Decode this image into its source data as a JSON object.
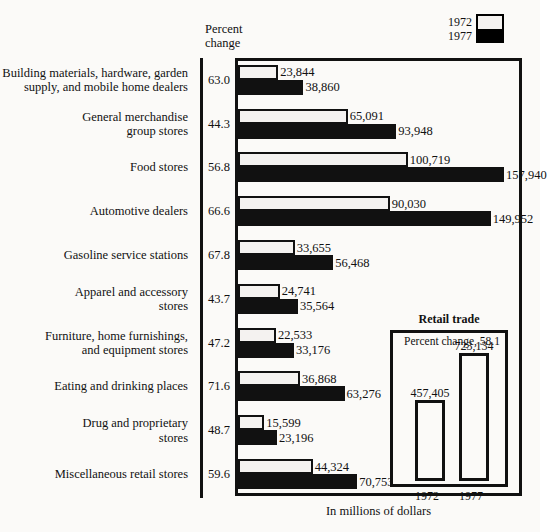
{
  "legend": {
    "entries": [
      {
        "label": "1972",
        "swatch": "white-swatch"
      },
      {
        "label": "1977",
        "swatch": "black-swatch"
      }
    ]
  },
  "axis": {
    "pct_header_line1": "Percent",
    "pct_header_line2": "change",
    "caption": "In millions of dollars"
  },
  "inset": {
    "title": "Retail trade",
    "subtitle": "Percent change, 58.1",
    "bars": [
      {
        "year": "1972",
        "value": "457,405",
        "number": 457405
      },
      {
        "year": "1977",
        "value": "723,134",
        "number": 723134
      }
    ]
  },
  "chart_data": {
    "type": "bar",
    "orientation": "horizontal",
    "title": "",
    "xlabel": "In millions of dollars",
    "ylabel": "",
    "grid": false,
    "legend_position": "top-right",
    "xlim": [
      0,
      165000
    ],
    "categories": [
      "Building materials, hardware, garden\nsupply, and mobile home dealers",
      "General merchandise\ngroup stores",
      "Food stores",
      "Automotive dealers",
      "Gasoline service stations",
      "Apparel and accessory\nstores",
      "Furniture, home furnishings,\nand equipment stores",
      "Eating and drinking places",
      "Drug and proprietary\nstores",
      "Miscellaneous retail stores"
    ],
    "percent_change": [
      "63.0",
      "44.3",
      "56.8",
      "66.6",
      "67.8",
      "43.7",
      "47.2",
      "71.6",
      "48.7",
      "59.6"
    ],
    "series": [
      {
        "name": "1972",
        "values": [
          23844,
          65091,
          100719,
          90030,
          33655,
          24741,
          22533,
          36868,
          15599,
          44324
        ],
        "labels": [
          "23,844",
          "65,091",
          "100,719",
          "90,030",
          "33,655",
          "24,741",
          "22,533",
          "36,868",
          "15,599",
          "44,324"
        ]
      },
      {
        "name": "1977",
        "values": [
          38860,
          93948,
          157940,
          149952,
          56468,
          35564,
          33176,
          63276,
          23196,
          70753
        ],
        "labels": [
          "38,860",
          "93,948",
          "157,940",
          "149,952",
          "56,468",
          "35,564",
          "33,176",
          "63,276",
          "23,196",
          "70,753"
        ]
      }
    ],
    "inset": {
      "type": "bar",
      "title": "Retail trade",
      "annotation": "Percent change, 58.1",
      "categories": [
        "1972",
        "1977"
      ],
      "values": [
        457405,
        723134
      ],
      "labels": [
        "457,405",
        "723,134"
      ]
    }
  },
  "colors": {
    "bar_1972": "#f4f2f0",
    "bar_1977": "#111111",
    "outline": "#111111",
    "background": "#fbfaf8"
  }
}
